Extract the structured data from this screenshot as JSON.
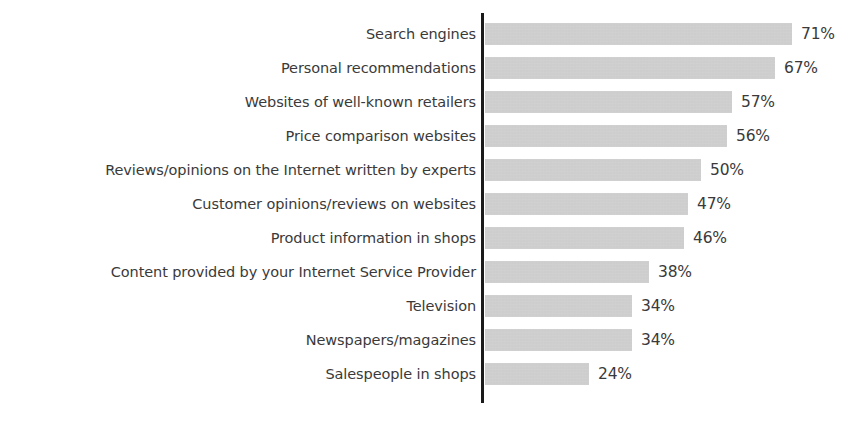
{
  "chart_data": {
    "type": "bar",
    "orientation": "horizontal",
    "title": "",
    "subtitle": "",
    "xlabel": "",
    "ylabel": "",
    "xlim": [
      0,
      71
    ],
    "grid": false,
    "legend": null,
    "value_suffix": "%",
    "bar_color": "#c9c9c9",
    "axis_color": "#1a1a1a",
    "text_color": "#3a3a3a",
    "background_color": "#ffffff",
    "categories": [
      "Search engines",
      "Personal recommendations",
      "Websites of well-known retailers",
      "Price comparison websites",
      "Reviews/opinions on the Internet written by experts",
      "Customer opinions/reviews on websites",
      "Product information in shops",
      "Content provided by your Internet Service Provider",
      "Television",
      "Newspapers/magazines",
      "Salespeople in shops"
    ],
    "values": [
      71,
      67,
      57,
      56,
      50,
      47,
      46,
      38,
      34,
      34,
      24
    ],
    "value_labels": [
      "71%",
      "67%",
      "57%",
      "56%",
      "50%",
      "47%",
      "46%",
      "38%",
      "34%",
      "34%",
      "24%"
    ]
  }
}
